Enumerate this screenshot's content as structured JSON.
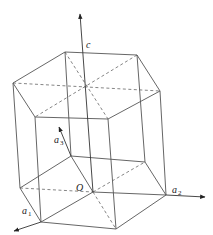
{
  "diagram": {
    "type": "hexagonal-prism-crystal-axes",
    "labels": {
      "c": "c",
      "origin": "O",
      "a1_base": "a",
      "a1_sub": "1",
      "a2_base": "a",
      "a2_sub": "2",
      "a3_base": "a",
      "a3_sub": "3"
    },
    "colors": {
      "edge": "#555555",
      "axis": "#333333",
      "background": "#ffffff"
    }
  }
}
